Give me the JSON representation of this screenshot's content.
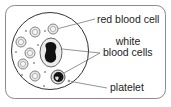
{
  "diagram": {
    "labels": {
      "red_blood_cell": "red blood cell",
      "white_line1": "white",
      "white_line2": "blood cells",
      "platelet": "platelet"
    },
    "colors": {
      "frame": "#888888",
      "outline": "#333333",
      "cell_fill": "#e6e6e6",
      "nucleus": "#111111",
      "dot": "#999999",
      "text": "#222222"
    },
    "components": [
      "blood vessel cross-section",
      "red blood cells",
      "white blood cells",
      "platelets"
    ]
  }
}
